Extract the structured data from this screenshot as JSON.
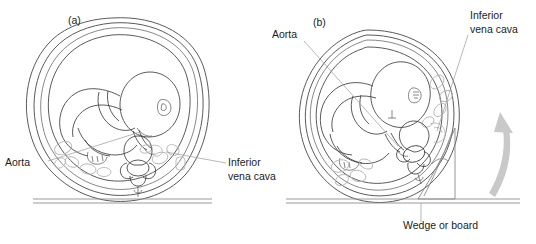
{
  "figure": {
    "background_color": "#ffffff",
    "line_color": "#3c3c3c",
    "organ_color": "#b6b6b6",
    "arrow_color": "#c9c9c9",
    "width": 536,
    "height": 244
  },
  "panels": [
    {
      "id": "a",
      "label": "(a)",
      "label_x": 68,
      "label_y": 24,
      "description": "Supine position - gravid uterus compressing inferior vena cava and aorta",
      "annotations": [
        {
          "name": "aorta",
          "lines": [
            "Aorta"
          ],
          "x": 5,
          "y": 166,
          "anchor": "start"
        },
        {
          "name": "inferior-vena-cava",
          "lines": [
            "Inferior",
            "vena cava"
          ],
          "x": 228,
          "y": 166,
          "anchor": "start"
        }
      ]
    },
    {
      "id": "b",
      "label": "(b)",
      "label_x": 313,
      "label_y": 26,
      "description": "Left lateral tilt using wedge - relieves aortocaval compression",
      "annotations": [
        {
          "name": "aorta",
          "lines": [
            "Aorta"
          ],
          "x": 272,
          "y": 38,
          "anchor": "start"
        },
        {
          "name": "inferior-vena-cava",
          "lines": [
            "Inferior",
            "vena cava"
          ],
          "x": 470,
          "y": 19,
          "anchor": "start"
        },
        {
          "name": "wedge-or-board",
          "lines": [
            "Wedge or board"
          ],
          "x": 403,
          "y": 229,
          "anchor": "start"
        }
      ]
    }
  ],
  "tilt_arrow": {
    "name": "tilt-direction-arrow",
    "direction": "counter-clockwise-up",
    "color": "#c9c9c9"
  }
}
